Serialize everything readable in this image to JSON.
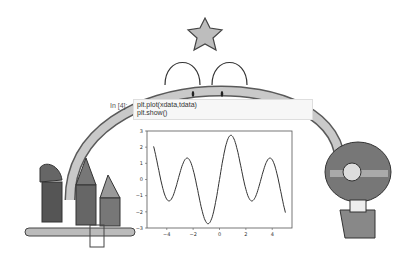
{
  "notebook": {
    "prompt": "In [4]:",
    "code_lines": [
      "plt.plot(xdata,tdata)",
      "plt.show()"
    ]
  },
  "illustration": {
    "characters": [
      "star-headed arch creature",
      "three gnomes on seesaw",
      "girl with headphones"
    ]
  },
  "chart_data": {
    "type": "line",
    "title": "",
    "xlabel": "",
    "ylabel": "",
    "xlim": [
      -5.5,
      5.5
    ],
    "ylim": [
      -3,
      3
    ],
    "xticks": [
      -4,
      -2,
      0,
      2,
      4
    ],
    "yticks": [
      3,
      2,
      1,
      0,
      -1,
      -2,
      -3
    ],
    "grid": false,
    "series": [
      {
        "name": "tdata",
        "x": [
          -5.0,
          -4.5,
          -4.0,
          -3.5,
          -3.0,
          -2.5,
          -2.0,
          -1.5,
          -1.0,
          -0.5,
          0.0,
          0.5,
          1.0,
          1.5,
          2.0,
          2.5,
          3.0,
          3.5,
          4.0,
          4.5,
          5.0
        ],
        "values": [
          2.05,
          -0.2,
          -1.22,
          -0.96,
          0.42,
          1.28,
          0.6,
          -1.28,
          -2.66,
          -2.16,
          0.0,
          2.16,
          2.66,
          1.28,
          -0.6,
          -1.28,
          -0.42,
          0.96,
          1.22,
          0.2,
          -2.05
        ]
      }
    ],
    "color": "#333333"
  }
}
